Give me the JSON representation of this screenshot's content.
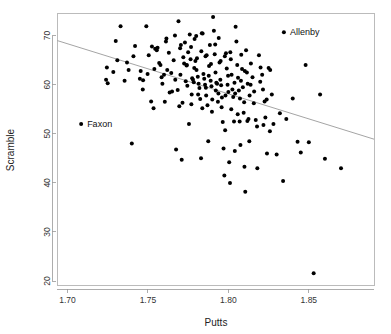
{
  "chart_data": {
    "type": "scatter",
    "title": "",
    "xlabel": "Putts",
    "ylabel": "Scramble",
    "xlim": [
      1.6935,
      1.8905
    ],
    "ylim": [
      19.2,
      74.6
    ],
    "xticks": [
      1.7,
      1.75,
      1.8,
      1.85
    ],
    "xticklabels": [
      "1.70",
      "1.75",
      "1.80",
      "1.85"
    ],
    "yticks": [
      20,
      30,
      40,
      50,
      60,
      70
    ],
    "yticklabels": [
      "20",
      "30",
      "40",
      "50",
      "60",
      "70"
    ],
    "grid": false,
    "legend": null,
    "point_color": "#000000",
    "point_size": 2.0,
    "fit_line": {
      "type": "linear-regression",
      "color": "#9a9a9a",
      "x_start": 1.6935,
      "y_start": 69.0,
      "x_end": 1.8905,
      "y_end": 48.9
    },
    "annotations": [
      {
        "label": "Faxon",
        "x": 1.7085,
        "y": 52.0
      },
      {
        "label": "Allenby",
        "x": 1.8345,
        "y": 70.7
      }
    ],
    "points": [
      [
        1.7085,
        52.0
      ],
      [
        1.8345,
        70.7
      ],
      [
        1.7245,
        63.5
      ],
      [
        1.725,
        60.3
      ],
      [
        1.73,
        68.9
      ],
      [
        1.733,
        71.9
      ],
      [
        1.7355,
        60.8
      ],
      [
        1.737,
        64.5
      ],
      [
        1.74,
        48.0
      ],
      [
        1.742,
        67.9
      ],
      [
        1.7455,
        62.8
      ],
      [
        1.747,
        60.9
      ],
      [
        1.749,
        71.9
      ],
      [
        1.7505,
        66.0
      ],
      [
        1.752,
        56.6
      ],
      [
        1.7535,
        55.2
      ],
      [
        1.7545,
        67.3
      ],
      [
        1.7555,
        67.0
      ],
      [
        1.756,
        67.5
      ],
      [
        1.7585,
        61.5
      ],
      [
        1.76,
        62.0
      ],
      [
        1.7605,
        56.5
      ],
      [
        1.7615,
        69.4
      ],
      [
        1.762,
        63.0
      ],
      [
        1.7635,
        58.4
      ],
      [
        1.765,
        58.6
      ],
      [
        1.766,
        65.0
      ],
      [
        1.767,
        61.0
      ],
      [
        1.7675,
        46.8
      ],
      [
        1.769,
        72.9
      ],
      [
        1.77,
        67.4
      ],
      [
        1.7705,
        68.1
      ],
      [
        1.771,
        44.7
      ],
      [
        1.7715,
        56.3
      ],
      [
        1.772,
        65.6
      ],
      [
        1.7725,
        64.3
      ],
      [
        1.7735,
        60.7
      ],
      [
        1.774,
        63.9
      ],
      [
        1.7745,
        59.8
      ],
      [
        1.775,
        66.6
      ],
      [
        1.7755,
        52.0
      ],
      [
        1.776,
        70.2
      ],
      [
        1.7765,
        65.2
      ],
      [
        1.777,
        56.0
      ],
      [
        1.7775,
        61.3
      ],
      [
        1.778,
        61.0
      ],
      [
        1.7785,
        60.5
      ],
      [
        1.779,
        69.3
      ],
      [
        1.7795,
        64.8
      ],
      [
        1.78,
        69.9
      ],
      [
        1.7805,
        65.4
      ],
      [
        1.781,
        61.6
      ],
      [
        1.7815,
        60.2
      ],
      [
        1.782,
        59.3
      ],
      [
        1.7825,
        57.1
      ],
      [
        1.783,
        45.0
      ],
      [
        1.7835,
        70.5
      ],
      [
        1.784,
        70.4
      ],
      [
        1.7845,
        62.2
      ],
      [
        1.785,
        61.2
      ],
      [
        1.7855,
        60.0
      ],
      [
        1.786,
        59.4
      ],
      [
        1.7865,
        66.0
      ],
      [
        1.787,
        55.8
      ],
      [
        1.7875,
        48.5
      ],
      [
        1.788,
        63.8
      ],
      [
        1.7885,
        68.1
      ],
      [
        1.789,
        60.8
      ],
      [
        1.7895,
        59.7
      ],
      [
        1.79,
        57.0
      ],
      [
        1.7905,
        73.8
      ],
      [
        1.791,
        71.0
      ],
      [
        1.7915,
        66.2
      ],
      [
        1.792,
        62.5
      ],
      [
        1.7925,
        60.4
      ],
      [
        1.793,
        60.2
      ],
      [
        1.7935,
        56.5
      ],
      [
        1.794,
        69.5
      ],
      [
        1.7945,
        64.5
      ],
      [
        1.795,
        61.0
      ],
      [
        1.7955,
        59.9
      ],
      [
        1.796,
        57.4
      ],
      [
        1.7965,
        52.4
      ],
      [
        1.797,
        47.0
      ],
      [
        1.7975,
        41.5
      ],
      [
        1.798,
        50.7
      ],
      [
        1.7985,
        66.4
      ],
      [
        1.799,
        63.3
      ],
      [
        1.7995,
        60.0
      ],
      [
        1.8,
        58.5
      ],
      [
        1.8005,
        44.2
      ],
      [
        1.801,
        40.0
      ],
      [
        1.8015,
        65.2
      ],
      [
        1.802,
        62.0
      ],
      [
        1.8025,
        59.0
      ],
      [
        1.803,
        57.5
      ],
      [
        1.8035,
        52.5
      ],
      [
        1.804,
        46.5
      ],
      [
        1.8045,
        71.8
      ],
      [
        1.805,
        68.8
      ],
      [
        1.8055,
        64.0
      ],
      [
        1.806,
        61.4
      ],
      [
        1.8065,
        58.8
      ],
      [
        1.807,
        52.5
      ],
      [
        1.8075,
        47.7
      ],
      [
        1.808,
        66.1
      ],
      [
        1.8085,
        63.2
      ],
      [
        1.809,
        59.5
      ],
      [
        1.8095,
        54.3
      ],
      [
        1.81,
        43.3
      ],
      [
        1.8105,
        38.2
      ],
      [
        1.811,
        67.0
      ],
      [
        1.8115,
        62.5
      ],
      [
        1.812,
        60.2
      ],
      [
        1.8125,
        53.0
      ],
      [
        1.813,
        48.5
      ],
      [
        1.814,
        64.3
      ],
      [
        1.815,
        61.5
      ],
      [
        1.816,
        58.6
      ],
      [
        1.817,
        52.8
      ],
      [
        1.818,
        43.0
      ],
      [
        1.819,
        66.0
      ],
      [
        1.82,
        63.5
      ],
      [
        1.821,
        62.0
      ],
      [
        1.8215,
        59.0
      ],
      [
        1.8225,
        56.6
      ],
      [
        1.823,
        53.3
      ],
      [
        1.824,
        46.0
      ],
      [
        1.825,
        63.4
      ],
      [
        1.826,
        63.0
      ],
      [
        1.827,
        58.0
      ],
      [
        1.828,
        52.0
      ],
      [
        1.83,
        45.8
      ],
      [
        1.832,
        54.2
      ],
      [
        1.834,
        40.4
      ],
      [
        1.836,
        53.0
      ],
      [
        1.84,
        57.2
      ],
      [
        1.843,
        48.4
      ],
      [
        1.845,
        46.2
      ],
      [
        1.848,
        64.0
      ],
      [
        1.85,
        48.3
      ],
      [
        1.853,
        21.6
      ],
      [
        1.857,
        58.0
      ],
      [
        1.86,
        44.9
      ],
      [
        1.87,
        43.0
      ],
      [
        1.7285,
        62.6
      ],
      [
        1.741,
        65.8
      ],
      [
        1.745,
        61.2
      ],
      [
        1.7525,
        67.8
      ],
      [
        1.754,
        63.2
      ],
      [
        1.757,
        64.4
      ],
      [
        1.759,
        60.2
      ],
      [
        1.763,
        66.5
      ],
      [
        1.7645,
        62.4
      ],
      [
        1.7685,
        58.9
      ],
      [
        1.7695,
        55.6
      ],
      [
        1.773,
        68.6
      ],
      [
        1.7768,
        67.7
      ],
      [
        1.7788,
        63.4
      ],
      [
        1.7812,
        58.0
      ],
      [
        1.7838,
        55.2
      ],
      [
        1.7858,
        65.8
      ],
      [
        1.7878,
        61.8
      ],
      [
        1.7898,
        54.5
      ],
      [
        1.7918,
        68.2
      ],
      [
        1.7938,
        58.2
      ],
      [
        1.7958,
        55.4
      ],
      [
        1.7978,
        65.8
      ],
      [
        1.7998,
        61.8
      ],
      [
        1.8018,
        55.0
      ],
      [
        1.8038,
        60.4
      ],
      [
        1.8058,
        54.0
      ],
      [
        1.8078,
        60.8
      ],
      [
        1.8098,
        56.4
      ],
      [
        1.8118,
        52.6
      ],
      [
        1.8138,
        60.0
      ],
      [
        1.8158,
        56.2
      ],
      [
        1.8178,
        51.5
      ],
      [
        1.8198,
        60.6
      ],
      [
        1.8218,
        51.8
      ],
      [
        1.8238,
        57.0
      ],
      [
        1.8258,
        50.5
      ],
      [
        1.724,
        61.0
      ],
      [
        1.731,
        65.0
      ],
      [
        1.738,
        63.0
      ],
      [
        1.7468,
        59.0
      ],
      [
        1.7498,
        62.2
      ],
      [
        1.7578,
        64.0
      ],
      [
        1.7612,
        68.8
      ],
      [
        1.7668,
        70.0
      ],
      [
        1.7702,
        62.0
      ],
      [
        1.7742,
        64.0
      ],
      [
        1.7772,
        58.0
      ],
      [
        1.7802,
        63.0
      ],
      [
        1.7832,
        66.8
      ],
      [
        1.7862,
        57.8
      ],
      [
        1.7892,
        64.2
      ],
      [
        1.7922,
        58.8
      ],
      [
        1.7952,
        64.8
      ],
      [
        1.7982,
        57.8
      ],
      [
        1.8012,
        66.6
      ],
      [
        1.8042,
        58.2
      ],
      [
        1.8072,
        57.2
      ],
      [
        1.8102,
        62.8
      ],
      [
        1.8132,
        57.8
      ]
    ]
  },
  "labels": {
    "x_axis_title": "Putts",
    "y_axis_title": "Scramble"
  }
}
